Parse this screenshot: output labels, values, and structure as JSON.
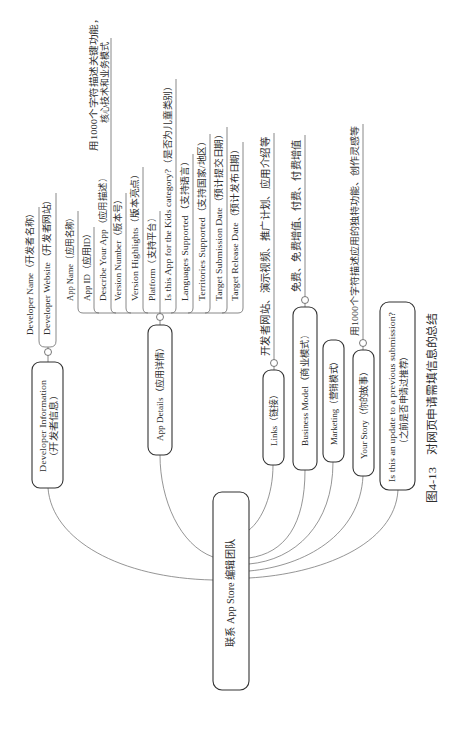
{
  "figure": {
    "number": "图4-13",
    "title": "对网页申请需填信息的总结"
  },
  "mindmap": {
    "central": {
      "label": "联系 App Store 编辑团队"
    },
    "developer_information": {
      "label_line1": "Developer Information",
      "label_line2": "（开发者信息）",
      "children": [
        {
          "label": "Developer Name（开发者名称）"
        },
        {
          "label": "Developer Website（开发者网站）"
        }
      ]
    },
    "app_details": {
      "label": "App Details（应用详情）",
      "children": [
        {
          "label": "App Name（应用名称）"
        },
        {
          "label": "App ID（应用ID）"
        },
        {
          "label": "Describe Your App（应用描述）",
          "note_line1": "用1000个字符描述关键功能，",
          "note_line2": "核心技术和业务模式"
        },
        {
          "label": "Version Number（版本号）"
        },
        {
          "label": "Version Highlights（版本亮点）"
        },
        {
          "label": "Platform（支持平台）"
        },
        {
          "label": "Is this App for the Kids category?（是否为儿童类别）"
        },
        {
          "label": "Languages Supported（支持语言）"
        },
        {
          "label": "Territories Supported（支持国家/地区）"
        },
        {
          "label": "Target Submission Date（预计提交日期）"
        },
        {
          "label": "Target Release Date（预计发布日期）"
        }
      ]
    },
    "links": {
      "label": "Links（链接）",
      "note": "开发者网站、演示视频、推广计划、应用介绍等"
    },
    "business_model": {
      "label": "Business Model（商业模式）",
      "note": "免费、免费增值、付费、付费增值"
    },
    "marketing": {
      "label": "Marketing（营销模式）"
    },
    "your_story": {
      "label": "Your Story（你的故事）",
      "note": "用1000个字符描述应用的独特功能、创作灵感等"
    },
    "previous_submission": {
      "label_line1": "Is this an update to a previous submission?",
      "label_line2": "（之前是否申请过推荐）"
    }
  }
}
